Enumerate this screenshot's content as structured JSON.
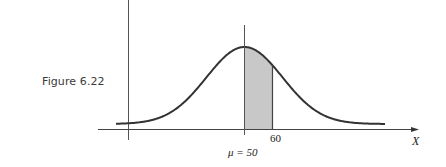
{
  "figure": {
    "label": "Figure 6.22"
  },
  "chart_data": {
    "type": "area",
    "title": "",
    "xlabel": "X",
    "ylabel": "",
    "distribution": "normal",
    "mean": 50,
    "mean_label": "μ = 50",
    "tick_labels": [
      "60"
    ],
    "shaded_region": {
      "from": 50,
      "to": 60
    },
    "colors": {
      "curve": "#333333",
      "shade": "#c8c8c8",
      "axis": "#444444"
    },
    "grid": false,
    "legend": null
  },
  "labels": {
    "x_axis": "X",
    "tick_60": "60",
    "mean": "μ = 50"
  }
}
